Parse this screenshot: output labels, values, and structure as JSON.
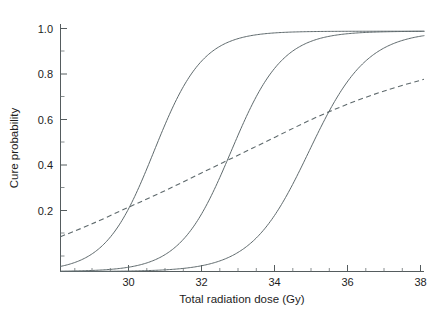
{
  "figure": {
    "background_color": "#ffffff",
    "curve_color": "#5f6a6d",
    "axis_color": "#555c5e"
  },
  "axis": {
    "x_title": "Total radiation dose (Gy)",
    "y_title": "Cure probability",
    "x_tick_labels": [
      "30",
      "32",
      "34",
      "36",
      "38"
    ],
    "y_tick_labels": [
      "0.2",
      "0.4",
      "0.6",
      "0.8",
      "1.0"
    ]
  },
  "chart_data": {
    "type": "line",
    "title": "",
    "subtitle": "",
    "xlabel": "Total radiation dose (Gy)",
    "ylabel": "Cure probability",
    "xlim": [
      28.2,
      38.0
    ],
    "ylim": [
      0.0,
      1.03
    ],
    "xticks": [
      30,
      32,
      34,
      36,
      38
    ],
    "xticks_minor": [
      28.5,
      29,
      29.5,
      30.5,
      31,
      31.5,
      32.5,
      33,
      33.5,
      34.5,
      35,
      35.5,
      36.5,
      37,
      37.5
    ],
    "yticks": [
      0.2,
      0.4,
      0.6,
      0.8,
      1.0
    ],
    "yticks_minor": [
      0.1,
      0.3,
      0.5,
      0.7,
      0.9
    ],
    "grid": false,
    "legend": "none",
    "series": [
      {
        "name": "Sigmoid curve 1 (left, steep)",
        "style": "solid",
        "model": "logistic",
        "d50": 30.72,
        "slope_k": 1.52,
        "x": [
          28.2,
          28.6,
          29.0,
          29.4,
          29.8,
          30.2,
          30.72,
          31.2,
          31.6,
          32.0,
          32.4,
          33.0,
          33.6,
          34.4,
          35.2,
          36.0,
          37.0,
          38.0
        ],
        "values": [
          0.02,
          0.03,
          0.06,
          0.11,
          0.19,
          0.32,
          0.5,
          0.67,
          0.79,
          0.86,
          0.92,
          0.96,
          0.98,
          0.99,
          0.995,
          0.998,
          0.999,
          1.0
        ]
      },
      {
        "name": "Sigmoid curve 2 (middle)",
        "style": "solid",
        "model": "logistic",
        "d50": 32.8,
        "slope_k": 1.45,
        "x": [
          28.2,
          29.2,
          30.0,
          30.6,
          31.2,
          31.8,
          32.3,
          32.8,
          33.3,
          33.8,
          34.4,
          35.0,
          35.8,
          36.6,
          37.2,
          38.0
        ],
        "values": [
          0.01,
          0.01,
          0.02,
          0.04,
          0.08,
          0.15,
          0.29,
          0.5,
          0.69,
          0.82,
          0.9,
          0.95,
          0.97,
          0.985,
          0.99,
          0.995
        ]
      },
      {
        "name": "Sigmoid curve 3 (right, shallow top)",
        "style": "solid",
        "model": "logistic",
        "d50": 34.9,
        "slope_k": 1.28,
        "x": [
          28.2,
          30.0,
          31.0,
          31.8,
          32.4,
          33.0,
          33.6,
          34.2,
          34.9,
          35.5,
          36.0,
          36.6,
          37.2,
          38.0
        ],
        "values": [
          0.005,
          0.01,
          0.015,
          0.03,
          0.06,
          0.11,
          0.2,
          0.33,
          0.5,
          0.64,
          0.74,
          0.82,
          0.88,
          0.93
        ]
      },
      {
        "name": "Dashed reference curve",
        "style": "dashed",
        "x": [
          28.2,
          29.0,
          30.0,
          31.0,
          32.0,
          33.0,
          34.0,
          35.0,
          36.0,
          37.0,
          38.0
        ],
        "values": [
          0.145,
          0.195,
          0.265,
          0.335,
          0.41,
          0.485,
          0.56,
          0.635,
          0.7,
          0.755,
          0.8
        ]
      }
    ]
  }
}
